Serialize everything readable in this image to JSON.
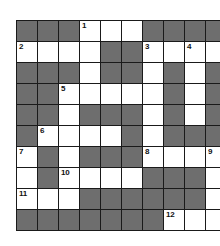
{
  "puzzle": {
    "type": "crossword",
    "rows": 10,
    "cols": 10,
    "colors": {
      "block": "#6e6e6e",
      "open": "#ffffff",
      "gridline": "#1a1a1a",
      "number": "#111111"
    },
    "grid": [
      [
        "B",
        "B",
        "B",
        "W",
        "W",
        "W",
        "B",
        "B",
        "B",
        "B"
      ],
      [
        "W",
        "W",
        "W",
        "W",
        "B",
        "B",
        "W",
        "W",
        "W",
        "W"
      ],
      [
        "B",
        "B",
        "B",
        "W",
        "B",
        "B",
        "W",
        "B",
        "W",
        "B"
      ],
      [
        "B",
        "B",
        "W",
        "W",
        "W",
        "W",
        "W",
        "B",
        "W",
        "B"
      ],
      [
        "B",
        "B",
        "W",
        "B",
        "B",
        "B",
        "W",
        "B",
        "W",
        "B"
      ],
      [
        "B",
        "W",
        "W",
        "W",
        "W",
        "B",
        "W",
        "B",
        "B",
        "B"
      ],
      [
        "W",
        "B",
        "W",
        "B",
        "B",
        "B",
        "W",
        "W",
        "W",
        "W"
      ],
      [
        "W",
        "B",
        "W",
        "W",
        "W",
        "W",
        "B",
        "B",
        "B",
        "W"
      ],
      [
        "W",
        "W",
        "W",
        "B",
        "B",
        "B",
        "B",
        "B",
        "B",
        "W"
      ],
      [
        "B",
        "B",
        "B",
        "B",
        "B",
        "B",
        "B",
        "W",
        "W",
        "W"
      ]
    ],
    "numbers": [
      {
        "row": 0,
        "col": 3,
        "label": "1"
      },
      {
        "row": 1,
        "col": 0,
        "label": "2"
      },
      {
        "row": 1,
        "col": 6,
        "label": "3"
      },
      {
        "row": 1,
        "col": 8,
        "label": "4"
      },
      {
        "row": 3,
        "col": 2,
        "label": "5"
      },
      {
        "row": 5,
        "col": 1,
        "label": "6"
      },
      {
        "row": 6,
        "col": 0,
        "label": "7"
      },
      {
        "row": 6,
        "col": 6,
        "label": "8"
      },
      {
        "row": 6,
        "col": 9,
        "label": "9"
      },
      {
        "row": 7,
        "col": 2,
        "label": "10"
      },
      {
        "row": 8,
        "col": 0,
        "label": "11"
      },
      {
        "row": 9,
        "col": 7,
        "label": "12"
      }
    ]
  }
}
